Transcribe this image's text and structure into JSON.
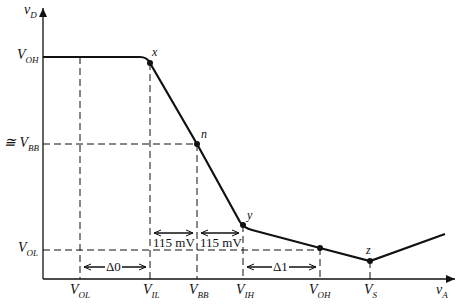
{
  "diagram": {
    "type": "voltage transfer characteristic",
    "axes": {
      "y": {
        "main": "v",
        "sub": "D"
      },
      "x": {
        "main": "v",
        "sub": "A"
      }
    },
    "y_labels": [
      {
        "main": "V",
        "sub": "OH",
        "prefix": ""
      },
      {
        "main": "V",
        "sub": "BB",
        "prefix": "≅ "
      },
      {
        "main": "V",
        "sub": "OL",
        "prefix": ""
      }
    ],
    "x_labels": [
      {
        "main": "V",
        "sub": "OL"
      },
      {
        "main": "V",
        "sub": "IL"
      },
      {
        "main": "V",
        "sub": "BB"
      },
      {
        "main": "V",
        "sub": "IH"
      },
      {
        "main": "V",
        "sub": "OH"
      },
      {
        "main": "V",
        "sub": "S"
      }
    ],
    "points": [
      "x",
      "n",
      "y",
      "z"
    ],
    "annotations": {
      "delta0": "Δ0",
      "delta1": "Δ1",
      "margin_left": "115 mV",
      "margin_right": "115 mV"
    }
  }
}
